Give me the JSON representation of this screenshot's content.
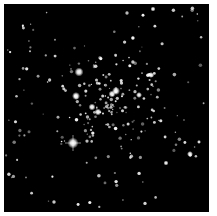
{
  "image": {
    "subject": "star-cluster",
    "background_color": "#000000",
    "frame_color": "#ffffff",
    "bright_stars": [
      {
        "x": 79,
        "y": 72,
        "r": 4.5
      },
      {
        "x": 76,
        "y": 96,
        "r": 4
      },
      {
        "x": 73,
        "y": 143,
        "r": 5.5,
        "spikes": true
      },
      {
        "x": 116,
        "y": 91,
        "r": 4
      },
      {
        "x": 112,
        "y": 94,
        "r": 3.5
      },
      {
        "x": 92,
        "y": 107,
        "r": 3.5
      },
      {
        "x": 98,
        "y": 112,
        "r": 3.5
      },
      {
        "x": 151,
        "y": 75,
        "r": 3
      },
      {
        "x": 139,
        "y": 95,
        "r": 3
      },
      {
        "x": 190,
        "y": 154,
        "r": 3
      },
      {
        "x": 166,
        "y": 163,
        "r": 2.5
      },
      {
        "x": 153,
        "y": 9,
        "r": 2.5
      }
    ]
  }
}
